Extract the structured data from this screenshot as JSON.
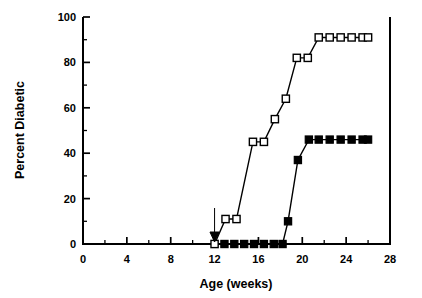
{
  "chart_data": {
    "type": "line",
    "title": "",
    "xlabel": "Age (weeks)",
    "ylabel": "Percent Diabetic",
    "xlim": [
      0,
      28
    ],
    "ylim": [
      0,
      100
    ],
    "xticks": [
      0,
      4,
      8,
      12,
      16,
      20,
      24,
      28
    ],
    "xticklabels": [
      "0",
      "4",
      "8",
      "12",
      "16",
      "20",
      "24",
      "28"
    ],
    "xminorticks": [
      2,
      6,
      10,
      14,
      18,
      22,
      26
    ],
    "yticks": [
      0,
      20,
      40,
      60,
      80,
      100
    ],
    "yticklabels": [
      "0",
      "20",
      "40",
      "60",
      "80",
      "100"
    ],
    "yminorticks": [
      10,
      30,
      50,
      70,
      90
    ],
    "grid": false,
    "legend": "none",
    "series": [
      {
        "name": "open-squares",
        "marker": "open-square",
        "color": "#000000",
        "x": [
          12,
          13,
          14,
          15.5,
          16.5,
          17.5,
          18.5,
          19.5,
          20.5,
          21.5,
          22.5,
          23.5,
          24.5,
          25.5,
          26
        ],
        "y": [
          0,
          11,
          11,
          45,
          45,
          55,
          64,
          82,
          82,
          91,
          91,
          91,
          91,
          91,
          91
        ]
      },
      {
        "name": "filled-squares",
        "marker": "filled-square",
        "color": "#000000",
        "x": [
          12.9,
          13.8,
          14.7,
          15.6,
          16.5,
          17.4,
          18.2,
          18.7,
          19.6,
          20.6,
          21.5,
          22.5,
          23.5,
          24.5,
          25.5,
          26
        ],
        "y": [
          0,
          0,
          0,
          0,
          0,
          0,
          0,
          10,
          37,
          46,
          46,
          46,
          46,
          46,
          46,
          46
        ]
      }
    ],
    "annotations": [
      {
        "type": "arrow",
        "label": "",
        "x": 12,
        "y": 0,
        "direction": "down"
      }
    ]
  }
}
